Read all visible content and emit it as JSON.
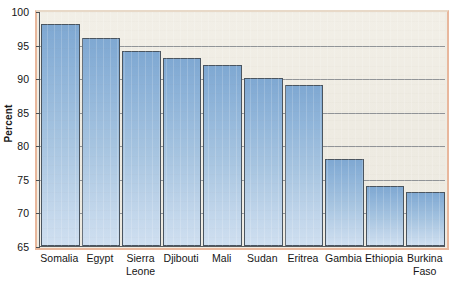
{
  "chart_data": {
    "type": "bar",
    "title": "",
    "subtitle": "",
    "xlabel": "",
    "ylabel": "Percent",
    "ylim": [
      65,
      100
    ],
    "ytick_step": 5,
    "yticks": [
      100,
      95,
      90,
      85,
      80,
      75,
      70,
      65
    ],
    "grid": true,
    "legend": false,
    "legend_position": "none",
    "categories": [
      "Somalia",
      "Sierra Leone",
      "Djibouti",
      "Mali",
      "Sudan",
      "Eritrea",
      "Gambia",
      "Ethiopia",
      "Burkina Faso",
      "Egypt"
    ],
    "category_lines": [
      [
        "Somalia",
        ""
      ],
      [
        "Egypt",
        ""
      ],
      [
        "Sierra",
        "Leone"
      ],
      [
        "Djibouti",
        ""
      ],
      [
        "Mali",
        ""
      ],
      [
        "Sudan",
        ""
      ],
      [
        "Eritrea",
        ""
      ],
      [
        "Gambia",
        ""
      ],
      [
        "Ethiopia",
        ""
      ],
      [
        "Burkina",
        "Faso"
      ]
    ],
    "ordered_categories": [
      "Somalia",
      "Egypt",
      "Sierra Leone",
      "Djibouti",
      "Mali",
      "Sudan",
      "Eritrea",
      "Gambia",
      "Ethiopia",
      "Burkina Faso"
    ],
    "values": [
      98,
      96,
      94,
      93,
      92,
      90,
      89,
      78,
      74,
      73
    ]
  },
  "style": {
    "bar_fill_top": "#7fa8d2",
    "bar_fill_bottom": "#cfdff0",
    "bar_border": "#4a5560",
    "plot_background": "#efece3",
    "gridline_color": "#7f8489",
    "frame_accent": "#e8b79c",
    "axis_color": "#555a5e",
    "text_color": "#161616",
    "page_background": "#ffffff"
  }
}
